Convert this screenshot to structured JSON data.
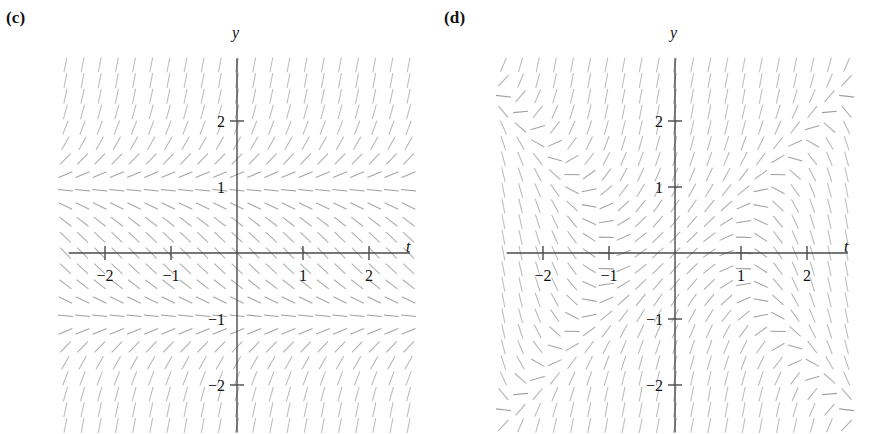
{
  "figure": {
    "width": 877,
    "height": 434,
    "background": "#ffffff",
    "ink_color": "#8d8d8d",
    "axis_color": "#4a4a4a",
    "text_color": "#111111"
  },
  "panels": [
    {
      "id": "c",
      "label": "(c)",
      "origin_x": 237,
      "origin_y": 253,
      "unit_px": 66,
      "x_axis_label": "t",
      "y_axis_label": "y",
      "x_axis_label_pos": {
        "x": 406,
        "y": 252
      },
      "y_axis_label_pos": {
        "x": 232,
        "y": 38
      },
      "x_ticks": [
        {
          "value": -2,
          "label": "−2"
        },
        {
          "value": -1,
          "label": "−1"
        },
        {
          "value": 1,
          "label": "1"
        },
        {
          "value": 2,
          "label": "2"
        }
      ],
      "y_ticks": [
        {
          "value": 2,
          "label": "2",
          "show_mark": true
        },
        {
          "value": 1,
          "label": "1",
          "show_mark": false
        },
        {
          "value": -1,
          "label": "−1",
          "show_mark": false
        },
        {
          "value": -2,
          "label": "−2",
          "show_mark": true
        }
      ],
      "field": {
        "equation": "dy/dt = y^2 - 1",
        "depends_on": "y",
        "equilibria": [
          1,
          -1
        ],
        "t_range": [
          -2.6,
          2.6
        ],
        "y_range": [
          -2.85,
          2.85
        ],
        "t_step": 0.26,
        "y_step": 0.2375,
        "dash_len_px": 15
      }
    },
    {
      "id": "d",
      "label": "(d)",
      "origin_x": 675,
      "origin_y": 253,
      "unit_px": 66,
      "x_axis_label": "t",
      "y_axis_label": "y",
      "x_axis_label_pos": {
        "x": 844,
        "y": 252
      },
      "y_axis_label_pos": {
        "x": 670,
        "y": 38
      },
      "x_ticks": [
        {
          "value": -2,
          "label": "−2"
        },
        {
          "value": -1,
          "label": "−1"
        },
        {
          "value": 1,
          "label": "1"
        },
        {
          "value": 2,
          "label": "2"
        }
      ],
      "y_ticks": [
        {
          "value": 2,
          "label": "2",
          "show_mark": true
        },
        {
          "value": 1,
          "label": "1",
          "show_mark": true
        },
        {
          "value": -1,
          "label": "−1",
          "show_mark": true
        },
        {
          "value": -2,
          "label": "−2",
          "show_mark": true
        }
      ],
      "field": {
        "equation": "dy/dt = y^2 - t^2 + 1",
        "depends_on": "t,y",
        "equilibria": [],
        "t_range": [
          -2.6,
          2.6
        ],
        "y_range": [
          -2.85,
          2.85
        ],
        "t_step": 0.26,
        "y_step": 0.2375,
        "dash_len_px": 15
      }
    }
  ],
  "chart_data": {
    "type": "scatter",
    "title": "",
    "subtitle": "",
    "xlabel": "t",
    "ylabel": "y",
    "xlim": [
      -2.6,
      2.6
    ],
    "ylim": [
      -2.85,
      2.85
    ],
    "grid": false,
    "legend": null,
    "panels": [
      {
        "name": "(c)",
        "equation": "dy/dt = y^2 - 1",
        "x_tick_values": [
          -2,
          -1,
          1,
          2
        ],
        "x_tick_labels": [
          "−2",
          "−1",
          "1",
          "2"
        ],
        "y_tick_values": [
          2,
          1,
          -1,
          -2
        ],
        "y_tick_labels": [
          "2",
          "1",
          "−1",
          "−2"
        ],
        "sample_slopes": [
          {
            "t": 0,
            "y": 2.5,
            "slope": 5.25
          },
          {
            "t": 0,
            "y": 2.0,
            "slope": 3.0
          },
          {
            "t": 0,
            "y": 1.5,
            "slope": 1.25
          },
          {
            "t": 0,
            "y": 1.0,
            "slope": 0.0
          },
          {
            "t": 0,
            "y": 0.5,
            "slope": -0.75
          },
          {
            "t": 0,
            "y": 0.0,
            "slope": -1.0
          },
          {
            "t": 0,
            "y": -0.5,
            "slope": -0.75
          },
          {
            "t": 0,
            "y": -1.0,
            "slope": 0.0
          },
          {
            "t": 0,
            "y": -1.5,
            "slope": 1.25
          },
          {
            "t": 0,
            "y": -2.0,
            "slope": 3.0
          },
          {
            "t": 0,
            "y": -2.5,
            "slope": 5.25
          }
        ]
      },
      {
        "name": "(d)",
        "equation": "dy/dt = y^2 - t^2 + 1",
        "x_tick_values": [
          -2,
          -1,
          1,
          2
        ],
        "x_tick_labels": [
          "−2",
          "−1",
          "1",
          "2"
        ],
        "y_tick_values": [
          2,
          1,
          -1,
          -2
        ],
        "y_tick_labels": [
          "2",
          "1",
          "−1",
          "−2"
        ],
        "sample_slopes": [
          {
            "t": 0,
            "y": 0,
            "slope": 1.0
          },
          {
            "t": 0,
            "y": 2,
            "slope": 5.0
          },
          {
            "t": -2,
            "y": 2,
            "slope": 1.0
          },
          {
            "t": -2,
            "y": 0,
            "slope": -3.0
          },
          {
            "t": -1,
            "y": -1,
            "slope": 1.0
          },
          {
            "t": -1.2,
            "y": -0.6,
            "slope": -0.08
          },
          {
            "t": 1.2,
            "y": -0.6,
            "slope": -0.08
          },
          {
            "t": 2,
            "y": -2,
            "slope": 1.0
          },
          {
            "t": 1,
            "y": -2,
            "slope": 4.0
          }
        ]
      }
    ]
  }
}
